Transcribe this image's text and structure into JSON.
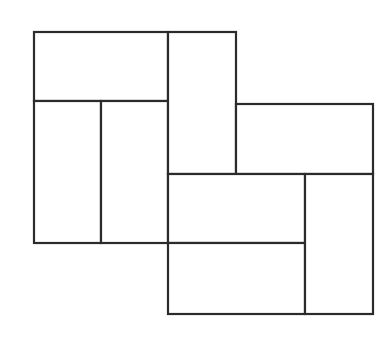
{
  "diagram": {
    "type": "rectangle-tiling",
    "width": 386,
    "height": 337,
    "stroke_color": "#2b2b2b",
    "fill_color": "#ffffff",
    "background": "#ffffff",
    "tiles": [
      {
        "id": "tile-1",
        "x": 34,
        "y": 32,
        "w": 134,
        "h": 69
      },
      {
        "id": "tile-2",
        "x": 34,
        "y": 101,
        "w": 67,
        "h": 142
      },
      {
        "id": "tile-3",
        "x": 101,
        "y": 101,
        "w": 67,
        "h": 142
      },
      {
        "id": "tile-4",
        "x": 168,
        "y": 32,
        "w": 68,
        "h": 142
      },
      {
        "id": "tile-5",
        "x": 236,
        "y": 104,
        "w": 137,
        "h": 70
      },
      {
        "id": "tile-6",
        "x": 168,
        "y": 174,
        "w": 137,
        "h": 69
      },
      {
        "id": "tile-7",
        "x": 168,
        "y": 243,
        "w": 137,
        "h": 71
      },
      {
        "id": "tile-8",
        "x": 305,
        "y": 174,
        "w": 68,
        "h": 140
      }
    ]
  }
}
